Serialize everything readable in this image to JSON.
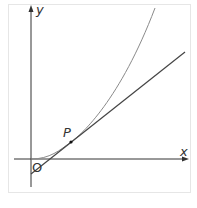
{
  "diagram": {
    "title": "",
    "labels": {
      "y_axis": "y",
      "x_axis": "x",
      "origin": "O",
      "point": "P"
    },
    "elements": [
      {
        "type": "axis",
        "name": "x-axis"
      },
      {
        "type": "axis",
        "name": "y-axis"
      },
      {
        "type": "curve",
        "description": "increasing convex curve through origin"
      },
      {
        "type": "line",
        "description": "tangent to curve at P, negative y-intercept"
      },
      {
        "type": "point",
        "label": "P"
      }
    ],
    "colors": {
      "axes": "#333333",
      "curve": "#8a8a8a",
      "tangent": "#444444",
      "frame": "#e6e6e6"
    }
  }
}
